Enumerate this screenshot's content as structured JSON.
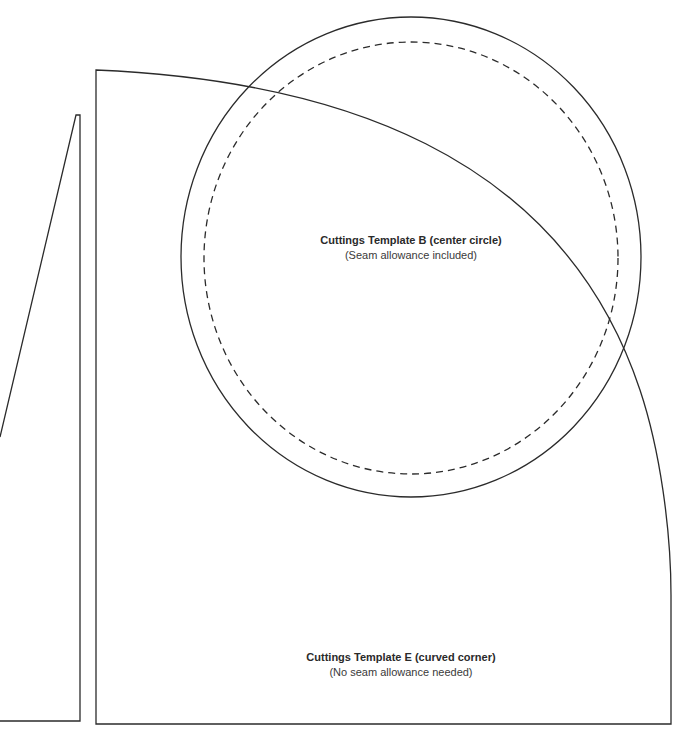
{
  "templates": {
    "b": {
      "title": "Cuttings Template B (center circle)",
      "subtitle": "(Seam allowance included)",
      "shape": "circle",
      "cut_line": "solid",
      "sew_line": "dashed"
    },
    "e": {
      "title": "Cuttings Template E (curved corner)",
      "subtitle": "(No seam allowance needed)",
      "shape": "curved-corner"
    },
    "partial_left": {
      "shape": "triangle-wedge"
    }
  },
  "colors": {
    "line": "#2b2b2b",
    "text": "#2a2a2a",
    "background": "#ffffff"
  }
}
